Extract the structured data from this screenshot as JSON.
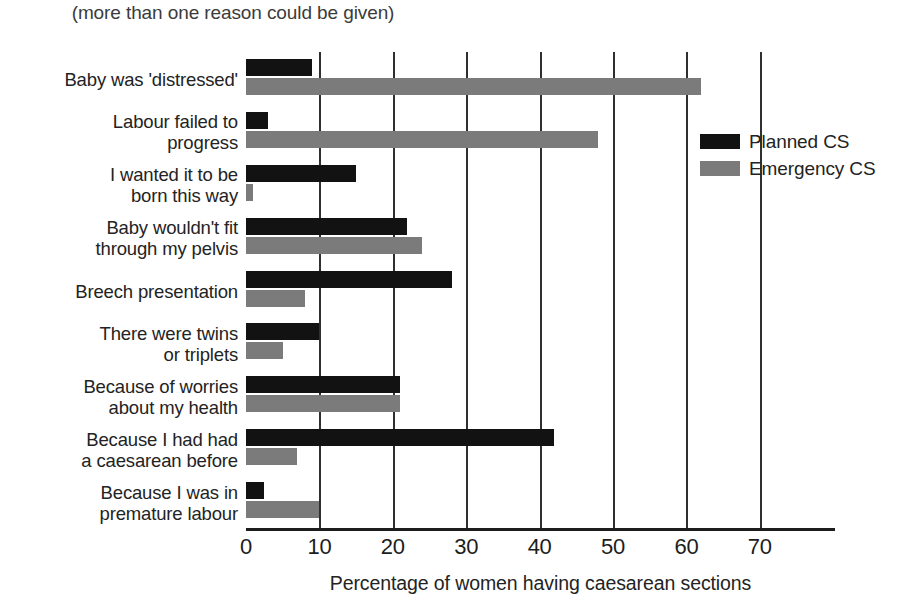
{
  "chart_data": {
    "type": "bar",
    "orientation": "horizontal",
    "title": "",
    "subtitle": "(more than one reason could be given)",
    "xlabel": "Percentage of women having caesarean sections",
    "ylabel": "",
    "xlim": [
      0,
      78
    ],
    "xticks": [
      0,
      10,
      20,
      30,
      40,
      50,
      60,
      70
    ],
    "xtick_labels": [
      "0",
      "10",
      "20",
      "30",
      "40",
      "50",
      "60",
      "70"
    ],
    "grid": "vertical",
    "legend_position": "right",
    "categories": [
      "Baby was 'distressed'",
      "Labour failed to progress",
      "I wanted it to be born this way",
      "Baby wouldn't fit through my pelvis",
      "Breech presentation",
      "There were twins or triplets",
      "Because of worries about my health",
      "Because I had had a caesarean before",
      "Because I was in premature labour"
    ],
    "category_lines": [
      [
        "Baby was 'distressed'"
      ],
      [
        "Labour failed to",
        "progress"
      ],
      [
        "I wanted it to be",
        "born this way"
      ],
      [
        "Baby wouldn't fit",
        "through my pelvis"
      ],
      [
        "Breech presentation"
      ],
      [
        "There were twins",
        "or triplets"
      ],
      [
        "Because of worries",
        "about my health"
      ],
      [
        "Because I had had",
        "a caesarean before"
      ],
      [
        "Because I was in",
        "premature labour"
      ]
    ],
    "series": [
      {
        "name": "Planned CS",
        "color": "#121212",
        "values": [
          9,
          3,
          15,
          22,
          28,
          10,
          21,
          42,
          2.5
        ]
      },
      {
        "name": "Emergency CS",
        "color": "#7b7b7b",
        "values": [
          62,
          48,
          1,
          24,
          8,
          5,
          21,
          7,
          10
        ]
      }
    ]
  },
  "legend": {
    "items": [
      {
        "label": "Planned CS",
        "color": "#121212"
      },
      {
        "label": "Emergency CS",
        "color": "#7b7b7b"
      }
    ]
  }
}
